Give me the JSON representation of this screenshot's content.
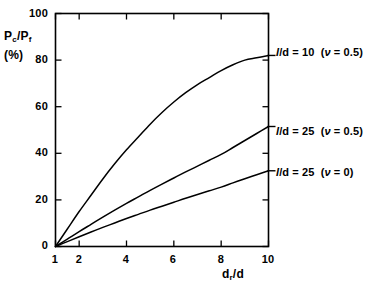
{
  "chart_data": {
    "type": "line",
    "title": "",
    "xlabel": "d_r/d",
    "xlabel_parts": {
      "base": "d",
      "sub": "r",
      "tail": "/d"
    },
    "ylabel": "P_c/P_f (%)",
    "ylabel_parts": {
      "num_base": "P",
      "num_sub": "c",
      "slash": "/",
      "den_base": "P",
      "den_sub": "f",
      "unit": "(%)"
    },
    "xlim": [
      1,
      10
    ],
    "ylim": [
      0,
      100
    ],
    "xticks": [
      1,
      2,
      4,
      6,
      8,
      10
    ],
    "xtick_labels": [
      "1",
      "2",
      "4",
      "6",
      "8",
      "10"
    ],
    "yticks": [
      0,
      20,
      40,
      60,
      80,
      100
    ],
    "ytick_labels": [
      "0",
      "20",
      "40",
      "60",
      "80",
      "100"
    ],
    "grid": false,
    "legend_position": "right-inline-annotations",
    "line_color": "#000000",
    "background_color": "#ffffff",
    "axis_color": "#000000",
    "series": [
      {
        "name": "l/d = 10 (v = 0.5)",
        "label_parts": {
          "l": "l",
          "mid": "/d = ",
          "ratio": "10",
          "open": "(",
          "nu": "ν",
          "eq": " = ",
          "nuval": "0.5",
          "close": ")"
        },
        "x": [
          1,
          1.5,
          2,
          2.5,
          3,
          3.5,
          4,
          4.5,
          5,
          5.5,
          6,
          6.5,
          7,
          7.5,
          8,
          8.5,
          9,
          9.5,
          10
        ],
        "values": [
          0,
          7.5,
          15,
          22,
          29,
          35.5,
          41.5,
          47,
          52.5,
          57.5,
          62,
          66,
          69.5,
          72.5,
          75.5,
          78,
          80,
          81,
          82
        ]
      },
      {
        "name": "l/d = 25 (v = 0.5)",
        "label_parts": {
          "l": "l",
          "mid": "/d = ",
          "ratio": "25",
          "open": "(",
          "nu": "ν",
          "eq": " = ",
          "nuval": "0.5",
          "close": ")"
        },
        "x": [
          1,
          1.5,
          2,
          2.5,
          3,
          3.5,
          4,
          4.5,
          5,
          5.5,
          6,
          6.5,
          7,
          7.5,
          8,
          8.5,
          9,
          9.5,
          10
        ],
        "values": [
          0,
          3.2,
          6.4,
          9.5,
          12.6,
          15.6,
          18.5,
          21.3,
          24.1,
          26.8,
          29.4,
          32,
          34.5,
          37,
          39.5,
          42.5,
          45.5,
          48.5,
          51.5
        ]
      },
      {
        "name": "l/d = 25 (v = 0)",
        "label_parts": {
          "l": "l",
          "mid": "/d = ",
          "ratio": "25",
          "open": "(",
          "nu": "ν",
          "eq": " = ",
          "nuval": "0",
          "close": ")"
        },
        "x": [
          1,
          1.5,
          2,
          2.5,
          3,
          3.5,
          4,
          4.5,
          5,
          5.5,
          6,
          6.5,
          7,
          7.5,
          8,
          8.5,
          9,
          9.5,
          10
        ],
        "values": [
          0,
          2.1,
          4.2,
          6.2,
          8.2,
          10.1,
          12,
          13.8,
          15.6,
          17.3,
          19,
          20.7,
          22.3,
          23.9,
          25.5,
          27.3,
          29.1,
          30.8,
          32.5
        ]
      }
    ]
  },
  "annotations": [
    {
      "text": "l/d = 10  (ν = 0.5)"
    },
    {
      "text": "l/d = 25  (ν = 0.5)"
    },
    {
      "text": "l/d = 25  (ν = 0)"
    }
  ]
}
